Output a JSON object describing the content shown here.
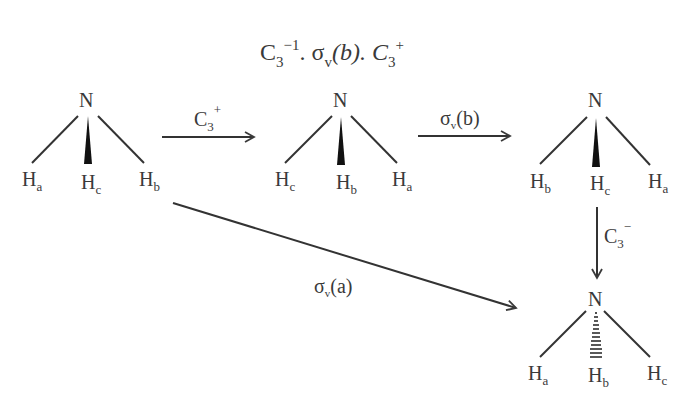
{
  "title": {
    "base1": "C",
    "sub1": "3",
    "sup1": "−1",
    "mid": ". σ",
    "sub2": "v",
    "paren": "(b). C",
    "sub3": "3",
    "sup3": "+"
  },
  "molecules": [
    {
      "n": "N",
      "left": {
        "h": "H",
        "s": "a"
      },
      "center": {
        "h": "H",
        "s": "c"
      },
      "right": {
        "h": "H",
        "s": "b"
      },
      "wedge": "solid"
    },
    {
      "n": "N",
      "left": {
        "h": "H",
        "s": "c"
      },
      "center": {
        "h": "H",
        "s": "b"
      },
      "right": {
        "h": "H",
        "s": "a"
      },
      "wedge": "solid"
    },
    {
      "n": "N",
      "left": {
        "h": "H",
        "s": "b"
      },
      "center": {
        "h": "H",
        "s": "c"
      },
      "right": {
        "h": "H",
        "s": "a"
      },
      "wedge": "solid"
    },
    {
      "n": "N",
      "left": {
        "h": "H",
        "s": "a"
      },
      "center": {
        "h": "H",
        "s": "b"
      },
      "right": {
        "h": "H",
        "s": "c"
      },
      "wedge": "hashed"
    }
  ],
  "arrows": {
    "a1": {
      "base": "C",
      "sub": "3",
      "sup": "+"
    },
    "a2": {
      "base": "σ",
      "sub": "v",
      "rest": "(b)"
    },
    "a3": {
      "base": "C",
      "sub": "3",
      "sup": "−"
    },
    "a4": {
      "base": "σ",
      "sub": "v",
      "rest": "(a)"
    }
  }
}
